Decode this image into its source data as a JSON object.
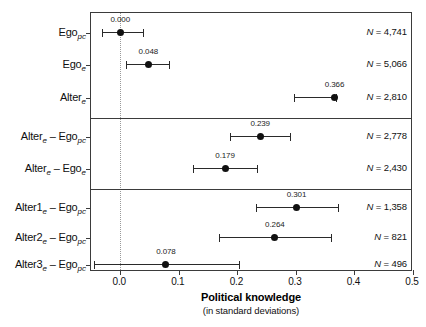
{
  "chart_data": {
    "type": "scatter",
    "title": "",
    "xlabel": "Political knowledge",
    "xlabel_sub": "(in standard deviations)",
    "ylabel": "",
    "xlim": [
      -0.05,
      0.5
    ],
    "xticks": [
      0.0,
      0.1,
      0.2,
      0.3,
      0.4,
      0.5
    ],
    "xticklabels": [
      "0.0",
      "0.1",
      "0.2",
      "0.3",
      "0.4",
      "0.5"
    ],
    "grid": false,
    "reference_line": 0.0,
    "legend": "none",
    "panels": [
      {
        "name": "levels",
        "rows": [
          0,
          1,
          2
        ]
      },
      {
        "name": "differences",
        "rows": [
          3,
          4
        ]
      },
      {
        "name": "alter-rank-differences",
        "rows": [
          5,
          6,
          7
        ]
      }
    ],
    "categories": [
      "Ego_pc",
      "Ego_e",
      "Alter_e",
      "Alter_e - Ego_pc",
      "Alter_e - Ego_e",
      "Alter1_e - Ego_pc",
      "Alter2_e - Ego_pc",
      "Alter3_e - Ego_pc"
    ],
    "points": [
      {
        "label_main": "Ego",
        "label_sub": "pc",
        "estimate": 0.0,
        "estimate_label": "0.000",
        "ci_low": -0.031,
        "ci_high": 0.038,
        "n_label": "N = 4,741",
        "n_value": 4741
      },
      {
        "label_main": "Ego",
        "label_sub": "e",
        "estimate": 0.048,
        "estimate_label": "0.048",
        "ci_low": 0.01,
        "ci_high": 0.083,
        "n_label": "N = 5,066",
        "n_value": 5066
      },
      {
        "label_main": "Alter",
        "label_sub": "e",
        "estimate": 0.366,
        "estimate_label": "0.366",
        "ci_low": 0.296,
        "ci_high": 0.369,
        "n_label": "N = 2,810",
        "n_value": 2810
      },
      {
        "label_main": "Alter",
        "label_sub": "e",
        "label_main2": " – Ego",
        "label_sub2": "pc",
        "estimate": 0.239,
        "estimate_label": "0.239",
        "ci_low": 0.188,
        "ci_high": 0.29,
        "n_label": "N = 2,778",
        "n_value": 2778
      },
      {
        "label_main": "Alter",
        "label_sub": "e",
        "label_main2": " – Ego",
        "label_sub2": "e",
        "estimate": 0.179,
        "estimate_label": "0.179",
        "ci_low": 0.124,
        "ci_high": 0.234,
        "n_label": "N = 2,430",
        "n_value": 2430
      },
      {
        "label_main": "Alter1",
        "label_sub": "e",
        "label_main2": " – Ego",
        "label_sub2": "pc",
        "estimate": 0.301,
        "estimate_label": "0.301",
        "ci_low": 0.231,
        "ci_high": 0.372,
        "n_label": "N = 1,358",
        "n_value": 1358
      },
      {
        "label_main": "Alter2",
        "label_sub": "e",
        "label_main2": " – Ego",
        "label_sub2": "pc",
        "estimate": 0.264,
        "estimate_label": "0.264",
        "ci_low": 0.169,
        "ci_high": 0.36,
        "n_label": "N = 821",
        "n_value": 821
      },
      {
        "label_main": "Alter3",
        "label_sub": "e",
        "label_main2": " – Ego",
        "label_sub2": "pc",
        "estimate": 0.078,
        "estimate_label": "0.078",
        "ci_low": -0.045,
        "ci_high": 0.203,
        "n_label": "N = 496",
        "n_value": 496
      }
    ]
  },
  "colors": {
    "point": "#111111",
    "line": "#2a2a2a",
    "frame": "#3b3b3b",
    "reference": "#9a9a9a",
    "background": "#ffffff"
  }
}
